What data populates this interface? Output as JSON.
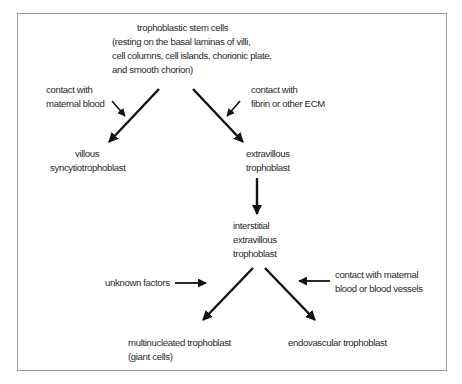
{
  "diagram": {
    "type": "flowchart",
    "nodes": {
      "stem_cells": {
        "title": "trophoblastic stem cells",
        "detail_lines": [
          "(resting on the basal laminas of villi,",
          "cell columns, cell islands, chorionic plate,",
          "and smooth chorion)"
        ]
      },
      "villous_syncytio": {
        "lines": [
          "villous",
          "syncytiotrophoblast"
        ]
      },
      "extravillous": {
        "lines": [
          "extravillous",
          "trophoblast"
        ]
      },
      "interstitial": {
        "lines": [
          "interstitial",
          "extravillous",
          "trophoblast"
        ]
      },
      "multinucleated": {
        "lines": [
          "multinucleated trophoblast",
          "(giant cells)"
        ]
      },
      "endovascular": {
        "lines": [
          "endovascular trophoblast"
        ]
      }
    },
    "factors": {
      "maternal_blood": {
        "lines": [
          "contact with",
          "maternal blood"
        ]
      },
      "fibrin_ecm": {
        "lines": [
          "contact with",
          "fibrin or other ECM"
        ]
      },
      "unknown": {
        "lines": [
          "unknown factors"
        ]
      },
      "maternal_vessels": {
        "lines": [
          "contact with maternal",
          "blood or blood vessels"
        ]
      }
    },
    "edges": [
      {
        "from": "stem_cells",
        "to": "villous_syncytio",
        "influenced_by": "maternal_blood"
      },
      {
        "from": "stem_cells",
        "to": "extravillous",
        "influenced_by": "fibrin_ecm"
      },
      {
        "from": "extravillous",
        "to": "interstitial"
      },
      {
        "from": "interstitial",
        "to": "multinucleated",
        "influenced_by": "unknown"
      },
      {
        "from": "interstitial",
        "to": "endovascular",
        "influenced_by": "maternal_vessels"
      }
    ],
    "colors": {
      "arrow": "#111111",
      "frame": "#9a9a9a",
      "text": "#2a2a2a"
    }
  }
}
